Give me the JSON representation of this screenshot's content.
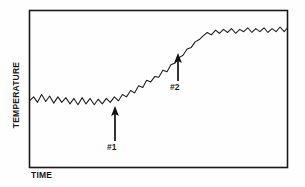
{
  "chart_data": {
    "type": "line",
    "title": "",
    "xlabel": "TIME",
    "ylabel": "TEMPERATURE",
    "grid": false,
    "legend": false,
    "xlim": [
      0,
      100
    ],
    "ylim": [
      0,
      100
    ],
    "axis_ticks": {
      "x": [],
      "y": []
    },
    "series": [
      {
        "name": "temperature",
        "color": "#1a1a1a",
        "x": [
          0,
          1.6,
          3.1,
          4.7,
          6.3,
          7.8,
          9.4,
          11.0,
          12.5,
          14.1,
          15.7,
          17.2,
          18.8,
          20.4,
          21.9,
          23.5,
          25.1,
          26.6,
          28.2,
          29.8,
          31.3,
          32.9,
          34.5,
          36.0,
          37.6,
          39.2,
          40.7,
          42.3,
          43.9,
          45.4,
          47.0,
          48.6,
          50.1,
          51.7,
          53.3,
          54.8,
          56.4,
          58.0,
          59.5,
          61.1,
          62.7,
          64.2,
          65.8,
          67.4,
          68.9,
          70.5,
          72.1,
          73.6,
          75.2,
          76.8,
          78.3,
          79.9,
          81.5,
          83.0,
          84.6,
          86.2,
          87.7,
          89.3,
          90.9,
          92.4,
          94.0,
          95.6,
          97.1,
          98.7,
          100.0
        ],
        "y": [
          42.5,
          45.0,
          41.5,
          46.5,
          42.0,
          45.5,
          41.0,
          45.0,
          41.5,
          44.5,
          40.5,
          44.0,
          40.0,
          44.5,
          40.5,
          44.0,
          40.0,
          43.5,
          40.5,
          44.0,
          41.5,
          45.0,
          42.5,
          46.5,
          45.0,
          49.0,
          47.5,
          52.0,
          51.0,
          55.5,
          54.5,
          58.0,
          57.5,
          62.0,
          61.0,
          65.5,
          66.5,
          70.0,
          71.5,
          75.5,
          76.5,
          80.0,
          81.5,
          84.0,
          86.0,
          84.5,
          87.5,
          85.5,
          88.0,
          86.0,
          88.5,
          85.5,
          88.0,
          86.5,
          89.0,
          86.0,
          88.5,
          86.5,
          89.0,
          86.0,
          88.5,
          86.5,
          89.5,
          86.5,
          89.0
        ]
      }
    ],
    "annotations": [
      {
        "label": "#1",
        "x": 39.0,
        "y": 42.0,
        "kind": "up-arrow",
        "note": "onset of temperature rise"
      },
      {
        "label": "#2",
        "x": 72.5,
        "y": 80.0,
        "kind": "up-arrow",
        "note": "approach to upper plateau"
      }
    ],
    "style": {
      "frame_color": "#1a1a1a",
      "line_color": "#1a1a1a",
      "background": "#fefefe",
      "arrow_color": "#111111"
    }
  }
}
